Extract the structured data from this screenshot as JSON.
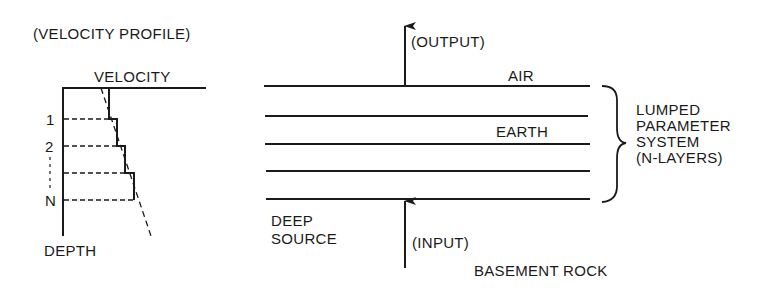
{
  "velocity_profile": {
    "title": "(VELOCITY PROFILE)",
    "x_axis_label": "VELOCITY",
    "y_axis_label": "DEPTH",
    "layer_labels": [
      "1",
      "2",
      "N"
    ]
  },
  "layered_model": {
    "output_label": "(OUTPUT)",
    "input_label": "(INPUT)",
    "air_label": "AIR",
    "earth_label": "EARTH",
    "deep_source_line1": "DEEP",
    "deep_source_line2": "SOURCE",
    "basement_label": "BASEMENT ROCK",
    "system_label": [
      "LUMPED",
      "PARAMETER",
      "SYSTEM",
      "(N-LAYERS)"
    ],
    "layer_count_lines": 5
  },
  "colors": {
    "ink": "#1a1a1a",
    "background": "#ffffff"
  }
}
